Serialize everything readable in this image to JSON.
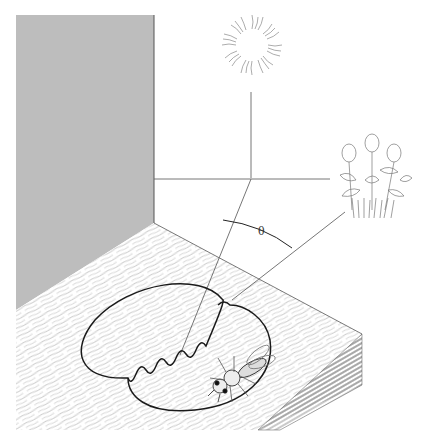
{
  "figure": {
    "elements": {
      "sun": "sun-icon",
      "flowers": "clover-flowers-icon",
      "bee": "bee-icon",
      "wall": "gray-vertical-wall",
      "table": "wood-grain-surface",
      "dance_path": "figure-eight-waggle-dance"
    },
    "angle_label": "θ"
  },
  "colors": {
    "wall": "#bdbdbd",
    "line": "#555555",
    "dance": "#1a1a1a",
    "wood_grain": "#9a9a9a",
    "background": "#ffffff"
  }
}
